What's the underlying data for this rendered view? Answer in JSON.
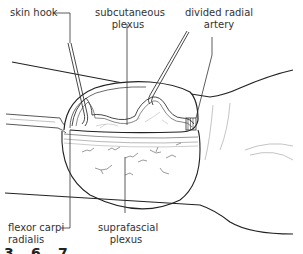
{
  "figure": {
    "labels": {
      "skin_hook": "skin hook",
      "subcutaneous_plexus_1": "subcutaneous",
      "subcutaneous_plexus_2": "plexus",
      "divided_radial_artery_1": "divided radial",
      "divided_radial_artery_2": "artery",
      "flexor_carpi_radialis_1": "flexor carpi",
      "flexor_carpi_radialis_2": "radialis",
      "suprafascial_plexus_1": "suprafascial",
      "suprafascial_plexus_2": "plexus"
    },
    "figure_number_partial": "3.6.7"
  },
  "colors": {
    "line": "#222222",
    "thin_line": "#555555",
    "faint_line": "#aaaaaa",
    "text": "#333333"
  }
}
